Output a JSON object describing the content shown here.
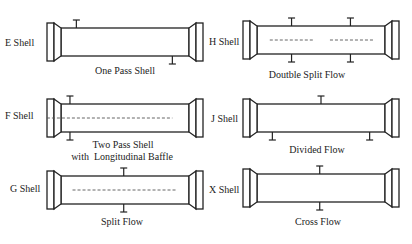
{
  "colors": {
    "line": "#222222",
    "dash": "#555555",
    "background": "#ffffff"
  },
  "shells": [
    {
      "id": "E",
      "name": "E Shell",
      "caption": [
        "One Pass Shell"
      ],
      "top_nozzles": [
        0.12
      ],
      "bottom_nozzles": [
        0.87
      ],
      "dashes": []
    },
    {
      "id": "H",
      "name": "H Shell",
      "caption": [
        "Doutble Split Flow"
      ],
      "top_nozzles": [
        0.27,
        0.73
      ],
      "bottom_nozzles": [
        0.27,
        0.73
      ],
      "dashes": [
        [
          0.1,
          0.44
        ],
        [
          0.57,
          0.91
        ]
      ]
    },
    {
      "id": "F",
      "name": "F Shell",
      "caption": [
        "Two Pass Shell",
        "with  Longitudinal Baffle"
      ],
      "top_nozzles": [
        0.07
      ],
      "bottom_nozzles": [
        0.07
      ],
      "dashes": [
        [
          -0.11,
          0.87
        ]
      ]
    },
    {
      "id": "J",
      "name": "J Shell",
      "caption": [
        "Divided Flow"
      ],
      "top_nozzles": [
        0.5
      ],
      "bottom_nozzles": [
        0.12,
        0.88
      ],
      "dashes": []
    },
    {
      "id": "G",
      "name": "G Shell",
      "caption": [
        "Split Flow"
      ],
      "top_nozzles": [
        0.49
      ],
      "bottom_nozzles": [
        0.49
      ],
      "dashes": [
        [
          0.09,
          0.9
        ]
      ]
    },
    {
      "id": "X",
      "name": "X Shell",
      "caption": [
        "Cross Flow"
      ],
      "top_nozzles": [
        0.49
      ],
      "bottom_nozzles": [
        0.49
      ],
      "dashes": []
    }
  ]
}
